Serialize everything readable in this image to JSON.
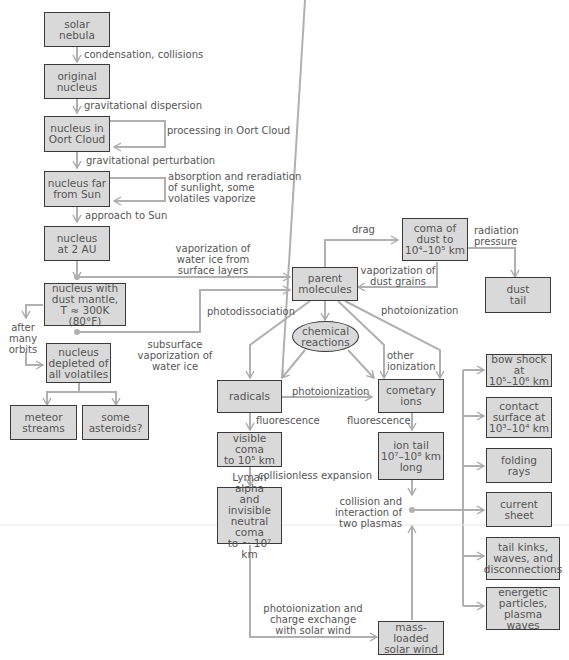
{
  "diagram": {
    "type": "flowchart",
    "colors": {
      "box_fill": "#d9d9d9",
      "box_border": "#3a3a3a",
      "line": "#b0b0b0",
      "text": "#555555"
    },
    "nodes": {
      "solar_nebula": "solar\nnebula",
      "original_nucleus": "original\nnucleus",
      "nucleus_oort": "nucleus in\nOort Cloud",
      "nucleus_far": "nucleus far\nfrom Sun",
      "nucleus_2au": "nucleus\nat 2 AU",
      "nucleus_mantle": "nucleus with\ndust mantle,\nT ≈ 300K (80°F)",
      "nucleus_depleted": "nucleus\ndepleted of\nall volatiles",
      "meteor_streams": "meteor\nstreams",
      "some_asteroids": "some\nasteroids?",
      "parent_molecules": "parent\nmolecules",
      "coma_dust": "coma of\ndust to\n10⁴–10⁵ km",
      "dust_tail": "dust\ntail",
      "chemical_reactions": "chemical\nreactions",
      "radicals": "radicals",
      "cometary_ions": "cometary\nions",
      "visible_coma": "visible coma\nto 10⁵ km",
      "ion_tail": "ion tail\n10⁷–10⁸ km\nlong",
      "lyman_alpha": "Lyman alpha\nand invisible\nneutral coma\nto ~ 10⁷ km",
      "mass_loaded": "mass-loaded\nsolar wind",
      "bow_shock": "bow shock at\n10⁵–10⁶ km",
      "contact_surface": "contact\nsurface at\n10³–10⁴ km",
      "folding_rays": "folding\nrays",
      "current_sheet": "current\nsheet",
      "tail_kinks": "tail kinks,\nwaves, and\ndisconnections",
      "energetic_particles": "energetic\nparticles,\nplasma waves"
    },
    "edge_labels": {
      "condensation": "condensation, collisions",
      "grav_dispersion": "gravitational dispersion",
      "processing_oort": "processing in Oort Cloud",
      "grav_perturbation": "gravitational perturbation",
      "absorption": "absorption and reradiation\nof sunlight, some\nvolatiles vaporize",
      "approach_sun": "approach to Sun",
      "vaporization_water": "vaporization of\nwater ice from\nsurface layers",
      "after_orbits": "after\nmany\norbits",
      "subsurface": "subsurface\nvaporization of\nwater ice",
      "drag": "drag",
      "radiation_pressure": "radiation\npressure",
      "vaporization_dust": "vaporization of\ndust grains",
      "photodissociation": "photodissociation",
      "photoionization_top": "photoionization",
      "other_ionization": "other\nionization",
      "photoionization_mid": "photoionization",
      "fluorescence_left": "fluorescence",
      "fluorescence_right": "fluorescence",
      "collisionless": "collisionless expansion",
      "collision_plasmas": "collision and\ninteraction of\ntwo plasmas",
      "photoionization_charge": "photoionization and\ncharge exchange\nwith solar wind"
    }
  }
}
